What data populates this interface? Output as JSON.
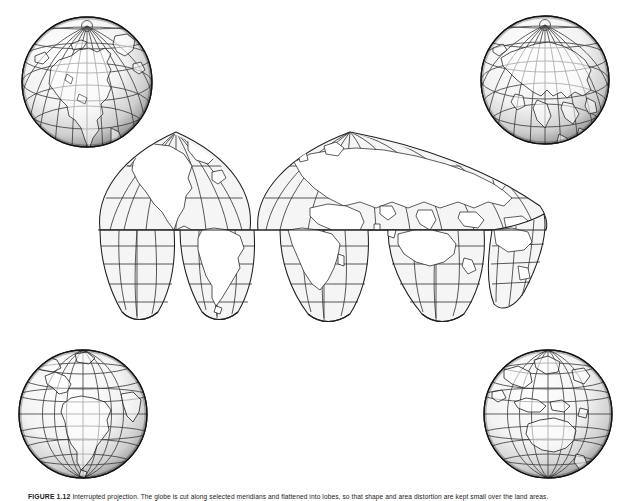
{
  "figure": {
    "caption_number": "FIGURE 1.12",
    "caption_text": "Interrupted projection. The globe is cut along selected meridians and flattened into lobes, so that shape and area distortion are kept small over the land areas.",
    "background_color": "#ffffff",
    "ink_color": "#1a1a1a",
    "land_fill": "#ffffff",
    "ocean_fill": "#f4f4f4",
    "graticule_color": "#3a3a3a"
  },
  "globes": [
    {
      "id": "globe-top-left",
      "name": "globe-north-america",
      "region": "North America / North Pole",
      "center_lon": -100,
      "center_lat": 45,
      "cx": 87,
      "cy": 80,
      "r": 72,
      "shading": "sphere-shaded-gray"
    },
    {
      "id": "globe-top-right",
      "name": "globe-eurasia",
      "region": "Eurasia / North Pole",
      "center_lon": 80,
      "center_lat": 45,
      "cx": 545,
      "cy": 78,
      "r": 70,
      "shading": "sphere-shaded-gray"
    },
    {
      "id": "globe-bottom-left",
      "name": "globe-south-america",
      "region": "South America",
      "center_lon": -60,
      "center_lat": -15,
      "cx": 83,
      "cy": 414,
      "r": 68,
      "shading": "sphere-shaded-gray"
    },
    {
      "id": "globe-bottom-right",
      "name": "globe-australia",
      "region": "Australia / Southeast Asia",
      "center_lon": 125,
      "center_lat": -15,
      "cx": 548,
      "cy": 414,
      "r": 68,
      "shading": "sphere-shaded-gray"
    }
  ],
  "map": {
    "projection": "Goode homolosine (interrupted sinusoidal-Mollweide)",
    "name": "interrupted-world-map",
    "graticule_interval_deg": 30,
    "lat_range": [
      -90,
      90
    ],
    "lon_range": [
      -180,
      180
    ],
    "northern_lobes": [
      {
        "name": "lobe-north-americas",
        "central_meridian": -100,
        "lon_span": [
          -180,
          -40
        ]
      },
      {
        "name": "lobe-eurasia-africa",
        "central_meridian": 20,
        "lon_span": [
          -40,
          180
        ]
      }
    ],
    "southern_lobes": [
      {
        "name": "lobe-pacific",
        "central_meridian": -160,
        "lon_span": [
          -180,
          -100
        ]
      },
      {
        "name": "lobe-south-america",
        "central_meridian": -60,
        "lon_span": [
          -100,
          -20
        ]
      },
      {
        "name": "lobe-africa",
        "central_meridian": 20,
        "lon_span": [
          -20,
          80
        ]
      },
      {
        "name": "lobe-australia",
        "central_meridian": 140,
        "lon_span": [
          80,
          180
        ]
      }
    ],
    "landmasses": [
      "North America",
      "South America",
      "Greenland",
      "Europe",
      "Africa",
      "Asia",
      "Australia",
      "Indonesia",
      "Japan",
      "British Isles"
    ]
  }
}
